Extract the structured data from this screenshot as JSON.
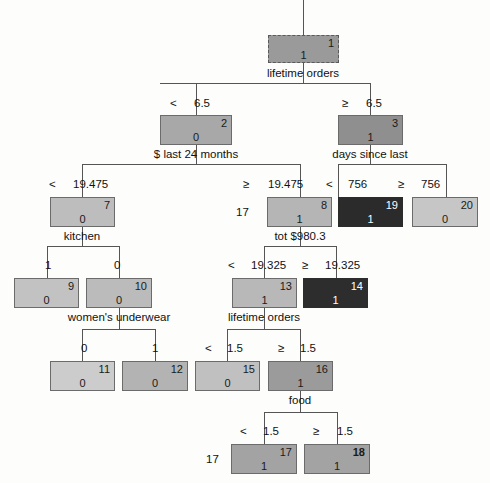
{
  "diagram": {
    "type": "decision-tree",
    "width": 490,
    "height": 483,
    "background": "#fdfdfc",
    "line_color": "#555555"
  },
  "nodes": [
    {
      "id": "1",
      "class_value": "1",
      "x": 268,
      "y": 35,
      "w": 71,
      "h": 28,
      "fill": "#9a9a9a",
      "border": "dashed",
      "text": "dark-on-light"
    },
    {
      "id": "2",
      "class_value": "0",
      "x": 160,
      "y": 115,
      "w": 72,
      "h": 30,
      "fill": "#a8a8a8",
      "border": "solid",
      "text": "dark-on-light"
    },
    {
      "id": "3",
      "class_value": "1",
      "x": 338,
      "y": 115,
      "w": 65,
      "h": 30,
      "fill": "#8f8f8f",
      "border": "solid",
      "text": "dark-on-light"
    },
    {
      "id": "7",
      "class_value": "0",
      "x": 50,
      "y": 197,
      "w": 65,
      "h": 30,
      "fill": "#bdbdbd",
      "border": "solid",
      "text": "dark-on-light"
    },
    {
      "id": "8",
      "class_value": "1",
      "x": 267,
      "y": 197,
      "w": 65,
      "h": 30,
      "fill": "#b5b5b5",
      "border": "solid",
      "text": "dark-on-light"
    },
    {
      "id": "19",
      "class_value": "1",
      "x": 338,
      "y": 197,
      "w": 65,
      "h": 30,
      "fill": "#2b2b2b",
      "border": "solid",
      "text": "light-on-dark"
    },
    {
      "id": "20",
      "class_value": "0",
      "x": 412,
      "y": 197,
      "w": 66,
      "h": 30,
      "fill": "#c6c6c6",
      "border": "solid",
      "text": "dark-on-light"
    },
    {
      "id": "9",
      "class_value": "0",
      "x": 14,
      "y": 278,
      "w": 65,
      "h": 30,
      "fill": "#c2c2c2",
      "border": "solid",
      "text": "dark-on-light"
    },
    {
      "id": "10",
      "class_value": "0",
      "x": 86,
      "y": 278,
      "w": 66,
      "h": 30,
      "fill": "#bbbbbb",
      "border": "solid",
      "text": "dark-on-light"
    },
    {
      "id": "13",
      "class_value": "1",
      "x": 232,
      "y": 278,
      "w": 65,
      "h": 30,
      "fill": "#b8b8b8",
      "border": "solid",
      "text": "dark-on-light"
    },
    {
      "id": "14",
      "class_value": "1",
      "x": 303,
      "y": 278,
      "w": 65,
      "h": 30,
      "fill": "#2d2d2d",
      "border": "solid",
      "text": "light-on-dark"
    },
    {
      "id": "11",
      "class_value": "0",
      "x": 50,
      "y": 361,
      "w": 65,
      "h": 30,
      "fill": "#cccccc",
      "border": "solid",
      "text": "dark-on-light"
    },
    {
      "id": "12",
      "class_value": "0",
      "x": 122,
      "y": 361,
      "w": 66,
      "h": 30,
      "fill": "#b3b3b3",
      "border": "solid",
      "text": "dark-on-light"
    },
    {
      "id": "15",
      "class_value": "0",
      "x": 195,
      "y": 361,
      "w": 65,
      "h": 30,
      "fill": "#c0c0c0",
      "border": "solid",
      "text": "dark-on-light"
    },
    {
      "id": "16",
      "class_value": "1",
      "x": 268,
      "y": 361,
      "w": 65,
      "h": 30,
      "fill": "#9b9b9b",
      "border": "solid",
      "text": "dark-on-light"
    },
    {
      "id": "17",
      "class_value": "1",
      "x": 231,
      "y": 444,
      "w": 66,
      "h": 30,
      "fill": "#a3a3a3",
      "border": "solid",
      "text": "dark-on-light"
    },
    {
      "id": "18",
      "class_value": "1",
      "x": 304,
      "y": 444,
      "w": 66,
      "h": 30,
      "fill": "#a3a3a3",
      "border": "solid",
      "text": "dark-on-light",
      "bold_id": true
    }
  ],
  "variable_labels": [
    {
      "name": "lifetime-orders-root",
      "text": "lifetime orders",
      "cx": 303,
      "y": 67
    },
    {
      "name": "dollar-last-24-months",
      "text": "$ last 24 months",
      "cx": 196,
      "y": 148
    },
    {
      "name": "days-since-last",
      "text": "days since last",
      "cx": 370,
      "y": 148
    },
    {
      "name": "kitchen",
      "text": "kitchen",
      "cx": 82,
      "y": 230
    },
    {
      "name": "tot-dollar-980-3",
      "text": "tot $980.3",
      "cx": 300,
      "y": 230
    },
    {
      "name": "womens-underwear",
      "text": "women's underwear",
      "cx": 119,
      "y": 311
    },
    {
      "name": "lifetime-orders-n13",
      "text": "lifetime orders",
      "cx": 264,
      "y": 311
    },
    {
      "name": "food",
      "text": "food",
      "cx": 300,
      "y": 394
    }
  ],
  "split_labels": [
    {
      "name": "split-root-left",
      "op": "<",
      "value": "6.5",
      "op_x": 170,
      "val_x": 194,
      "y": 97
    },
    {
      "name": "split-root-right",
      "op": "≥",
      "value": "6.5",
      "op_x": 342,
      "val_x": 366,
      "y": 97
    },
    {
      "name": "split-n2-left",
      "op": "<",
      "value": "19.475",
      "op_x": 49,
      "val_x": 73,
      "y": 178
    },
    {
      "name": "split-n2-right",
      "op": "≥",
      "value": "19.475",
      "op_x": 243,
      "val_x": 268,
      "y": 178
    },
    {
      "name": "split-n3-left",
      "op": "<",
      "value": "756",
      "op_x": 326,
      "val_x": 348,
      "y": 178
    },
    {
      "name": "split-n3-right",
      "op": "≥",
      "value": "756",
      "op_x": 398,
      "val_x": 421,
      "y": 178
    },
    {
      "name": "split-n7-left",
      "op": "1",
      "value": "",
      "op_x": 45,
      "val_x": 45,
      "y": 259
    },
    {
      "name": "split-n7-right",
      "op": "0",
      "value": "",
      "op_x": 114,
      "val_x": 114,
      "y": 259
    },
    {
      "name": "split-n8-left",
      "op": "<",
      "value": "19.325",
      "op_x": 228,
      "val_x": 251,
      "y": 259
    },
    {
      "name": "split-n8-right",
      "op": "≥",
      "value": "19.325",
      "op_x": 302,
      "val_x": 325,
      "y": 259
    },
    {
      "name": "split-n10-left",
      "op": "0",
      "value": "",
      "op_x": 81,
      "val_x": 81,
      "y": 342
    },
    {
      "name": "split-n10-right",
      "op": "1",
      "value": "",
      "op_x": 152,
      "val_x": 152,
      "y": 342
    },
    {
      "name": "split-n13-left",
      "op": "<",
      "value": "1.5",
      "op_x": 205,
      "val_x": 227,
      "y": 342
    },
    {
      "name": "split-n13-right",
      "op": "≥",
      "value": "1.5",
      "op_x": 278,
      "val_x": 300,
      "y": 342
    },
    {
      "name": "split-n16-left",
      "op": "<",
      "value": "1.5",
      "op_x": 240,
      "val_x": 263,
      "y": 425
    },
    {
      "name": "split-n16-right",
      "op": "≥",
      "value": "1.5",
      "op_x": 313,
      "val_x": 337,
      "y": 425
    }
  ],
  "side_labels": [
    {
      "name": "side-label-node8",
      "text": "17",
      "x": 236,
      "y": 206
    },
    {
      "name": "side-label-node17",
      "text": "17",
      "x": 206,
      "y": 453
    }
  ],
  "edges": [
    {
      "name": "edge-root-stem",
      "type": "v",
      "x": 303,
      "y": 0,
      "len": 35
    },
    {
      "name": "edge-root-down",
      "type": "v",
      "x": 303,
      "y": 63,
      "len": 20
    },
    {
      "name": "edge-root-bus",
      "type": "h",
      "x": 160,
      "y": 83,
      "len": 210
    },
    {
      "name": "edge-root-to-n2",
      "type": "v",
      "x": 196,
      "y": 83,
      "len": 32
    },
    {
      "name": "edge-root-to-n3",
      "type": "v",
      "x": 370,
      "y": 83,
      "len": 32
    },
    {
      "name": "edge-n2-down",
      "type": "v",
      "x": 196,
      "y": 145,
      "len": 19
    },
    {
      "name": "edge-n2-bus",
      "type": "h",
      "x": 82,
      "y": 164,
      "len": 218
    },
    {
      "name": "edge-n2-to-n7",
      "type": "v",
      "x": 82,
      "y": 164,
      "len": 33
    },
    {
      "name": "edge-n2-to-n8",
      "type": "v",
      "x": 300,
      "y": 164,
      "len": 33
    },
    {
      "name": "edge-n3-down",
      "type": "v",
      "x": 370,
      "y": 145,
      "len": 19
    },
    {
      "name": "edge-n3-bus",
      "type": "h",
      "x": 338,
      "y": 164,
      "len": 108
    },
    {
      "name": "edge-n3-to-n19",
      "type": "v",
      "x": 338,
      "y": 164,
      "len": 33
    },
    {
      "name": "edge-n3-to-n20",
      "type": "v",
      "x": 446,
      "y": 164,
      "len": 33
    },
    {
      "name": "edge-n7-down",
      "type": "v",
      "x": 82,
      "y": 227,
      "len": 19
    },
    {
      "name": "edge-n7-bus",
      "type": "h",
      "x": 47,
      "y": 246,
      "len": 72
    },
    {
      "name": "edge-n7-to-n9",
      "type": "v",
      "x": 47,
      "y": 246,
      "len": 32
    },
    {
      "name": "edge-n7-to-n10",
      "type": "v",
      "x": 119,
      "y": 246,
      "len": 32
    },
    {
      "name": "edge-n8-down",
      "type": "v",
      "x": 300,
      "y": 227,
      "len": 19
    },
    {
      "name": "edge-n8-bus",
      "type": "h",
      "x": 264,
      "y": 246,
      "len": 72
    },
    {
      "name": "edge-n8-to-n13",
      "type": "v",
      "x": 264,
      "y": 246,
      "len": 32
    },
    {
      "name": "edge-n8-to-n14",
      "type": "v",
      "x": 336,
      "y": 246,
      "len": 32
    },
    {
      "name": "edge-n10-down",
      "type": "v",
      "x": 119,
      "y": 308,
      "len": 21
    },
    {
      "name": "edge-n10-bus",
      "type": "h",
      "x": 82,
      "y": 329,
      "len": 73
    },
    {
      "name": "edge-n10-to-n11",
      "type": "v",
      "x": 82,
      "y": 329,
      "len": 32
    },
    {
      "name": "edge-n10-to-n12",
      "type": "v",
      "x": 155,
      "y": 329,
      "len": 32
    },
    {
      "name": "edge-n13-down",
      "type": "v",
      "x": 264,
      "y": 308,
      "len": 21
    },
    {
      "name": "edge-n13-bus",
      "type": "h",
      "x": 227,
      "y": 329,
      "len": 73
    },
    {
      "name": "edge-n13-to-n15",
      "type": "v",
      "x": 227,
      "y": 329,
      "len": 32
    },
    {
      "name": "edge-n13-to-n16",
      "type": "v",
      "x": 300,
      "y": 329,
      "len": 32
    },
    {
      "name": "edge-n16-down",
      "type": "v",
      "x": 300,
      "y": 391,
      "len": 21
    },
    {
      "name": "edge-n16-bus",
      "type": "h",
      "x": 264,
      "y": 412,
      "len": 73
    },
    {
      "name": "edge-n16-to-n17",
      "type": "v",
      "x": 264,
      "y": 412,
      "len": 32
    },
    {
      "name": "edge-n16-to-n18",
      "type": "v",
      "x": 337,
      "y": 412,
      "len": 32
    }
  ]
}
